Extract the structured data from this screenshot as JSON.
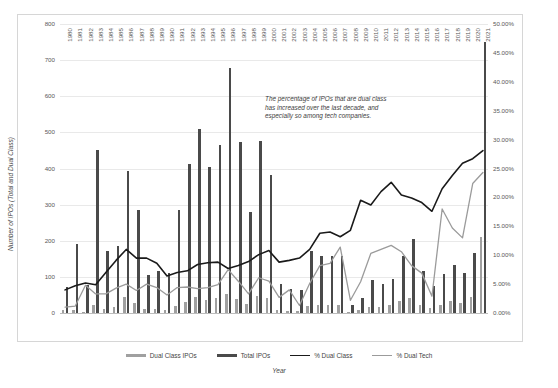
{
  "chart_data": {
    "type": "bar",
    "title": "",
    "xlabel": "Year",
    "ylabel": "Number of IPOs (Total and Dual Class)",
    "ylabel_right": "% of IPOs with Dual-Class Shares",
    "ylim": [
      0,
      800
    ],
    "ylim_right": [
      0,
      0.5
    ],
    "yticks": [
      "0",
      "100",
      "200",
      "300",
      "400",
      "500",
      "600",
      "700",
      "800"
    ],
    "yticks_right": [
      "0.00%",
      "5.00%",
      "10.00%",
      "15.00%",
      "20.00%",
      "25.00%",
      "30.00%",
      "35.00%",
      "40.00%",
      "45.00%",
      "50.00%"
    ],
    "grid": true,
    "legend_position": "bottom",
    "annotation": "The percentage of IPOs that are dual class has increased over the last decade, and especially so among tech companies.",
    "categories": [
      "1980",
      "1981",
      "1982",
      "1983",
      "1984",
      "1985",
      "1986",
      "1987",
      "1988",
      "1989",
      "1990",
      "1991",
      "1992",
      "1993",
      "1994",
      "1995",
      "1996",
      "1997",
      "1998",
      "1999",
      "2000",
      "2001",
      "2002",
      "2003",
      "2004",
      "2005",
      "2006",
      "2007",
      "2008",
      "2009",
      "2010",
      "2011",
      "2012",
      "2013",
      "2014",
      "2015",
      "2016",
      "2017",
      "2018",
      "2019",
      "2020",
      "2021"
    ],
    "series": [
      {
        "name": "Total IPOs",
        "type": "bar",
        "axis": "left",
        "color": "#4a4a4a",
        "values": [
          71,
          192,
          77,
          451,
          171,
          186,
          393,
          285,
          105,
          116,
          110,
          286,
          412,
          510,
          403,
          464,
          677,
          474,
          281,
          476,
          381,
          79,
          66,
          63,
          173,
          159,
          157,
          159,
          21,
          41,
          91,
          81,
          93,
          157,
          206,
          115,
          74,
          107,
          134,
          112,
          165,
          751
        ]
      },
      {
        "name": "Dual Class IPOs",
        "type": "bar",
        "axis": "left",
        "color": "#a0a0a0",
        "values": [
          9,
          9,
          4,
          22,
          12,
          17,
          43,
          27,
          10,
          10,
          7,
          20,
          30,
          43,
          35,
          41,
          52,
          39,
          25,
          48,
          41,
          7,
          6,
          6,
          19,
          22,
          22,
          21,
          3,
          8,
          17,
          17,
          21,
          32,
          41,
          22,
          13,
          23,
          32,
          29,
          44,
          211
        ]
      },
      {
        "name": "% Dual Class",
        "type": "line",
        "axis": "right",
        "color": "#1a1a1a",
        "values": [
          0.04,
          0.047,
          0.052,
          0.049,
          0.07,
          0.091,
          0.11,
          0.095,
          0.095,
          0.086,
          0.064,
          0.07,
          0.073,
          0.084,
          0.087,
          0.088,
          0.077,
          0.082,
          0.089,
          0.101,
          0.108,
          0.088,
          0.091,
          0.095,
          0.11,
          0.138,
          0.14,
          0.132,
          0.143,
          0.195,
          0.187,
          0.21,
          0.226,
          0.204,
          0.199,
          0.191,
          0.176,
          0.215,
          0.238,
          0.259,
          0.267,
          0.281
        ]
      },
      {
        "name": "% Dual Tech",
        "type": "line",
        "axis": "right",
        "color": "#9b9b9b",
        "values": [
          0.01,
          0.012,
          0.048,
          0.033,
          0.033,
          0.043,
          0.05,
          0.039,
          0.05,
          0.044,
          0.031,
          0.044,
          0.045,
          0.042,
          0.044,
          0.049,
          0.075,
          0.055,
          0.033,
          0.061,
          0.055,
          0.027,
          0.04,
          0.013,
          0.051,
          0.082,
          0.086,
          0.114,
          0.022,
          0.054,
          0.103,
          0.11,
          0.117,
          0.106,
          0.082,
          0.069,
          0.029,
          0.18,
          0.147,
          0.13,
          0.224,
          0.243
        ]
      }
    ]
  },
  "legend": {
    "items": [
      {
        "label": "Dual Class IPOs",
        "color": "#a0a0a0"
      },
      {
        "label": "Total IPOs",
        "color": "#4a4a4a"
      },
      {
        "label": "% Dual Class",
        "color": "#1a1a1a"
      },
      {
        "label": "% Dual Tech",
        "color": "#9b9b9b"
      }
    ]
  }
}
